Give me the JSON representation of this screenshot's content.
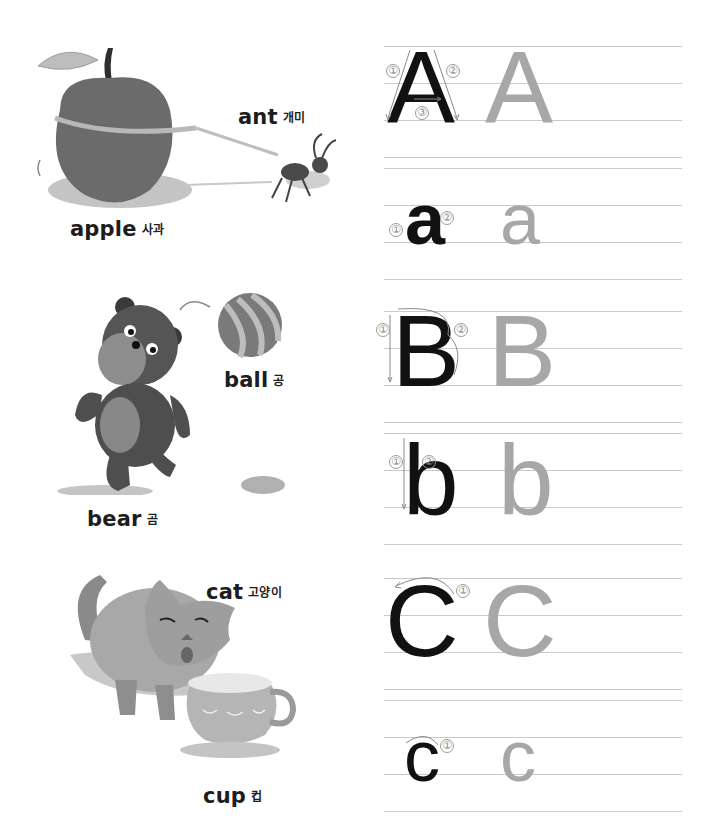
{
  "worksheet": {
    "vocabulary": [
      {
        "id": "apple",
        "english": "apple",
        "korean": "사과"
      },
      {
        "id": "ant",
        "english": "ant",
        "korean": "개미"
      },
      {
        "id": "ball",
        "english": "ball",
        "korean": "공"
      },
      {
        "id": "bear",
        "english": "bear",
        "korean": "곰"
      },
      {
        "id": "cat",
        "english": "cat",
        "korean": "고양이"
      },
      {
        "id": "cup",
        "english": "cup",
        "korean": "컵"
      }
    ],
    "letters": [
      {
        "case": "upper",
        "model": "A",
        "trace": "A",
        "strokes": [
          "①",
          "②",
          "③"
        ]
      },
      {
        "case": "lower",
        "model": "a",
        "trace": "a",
        "strokes": [
          "①",
          "②"
        ]
      },
      {
        "case": "upper",
        "model": "B",
        "trace": "B",
        "strokes": [
          "①",
          "②"
        ]
      },
      {
        "case": "lower",
        "model": "b",
        "trace": "b",
        "strokes": [
          "①",
          "②"
        ]
      },
      {
        "case": "upper",
        "model": "C",
        "trace": "C",
        "strokes": [
          "①"
        ]
      },
      {
        "case": "lower",
        "model": "c",
        "trace": "c",
        "strokes": [
          "①"
        ]
      }
    ],
    "colors": {
      "model_letter": "#111111",
      "trace_letter": "#a7a7a7",
      "rule_line": "#c9c9c9",
      "stroke_number": "#8a8a8a"
    }
  }
}
